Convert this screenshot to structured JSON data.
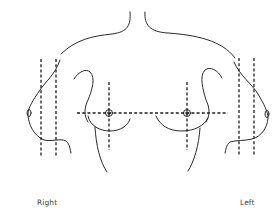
{
  "diagram": {
    "labels": {
      "right": "Right",
      "left": "Left"
    },
    "views": [
      {
        "id": "right-profile",
        "description": "right breast lateral profile with two vertical reference lines"
      },
      {
        "id": "frontal",
        "description": "frontal view of both breasts with horizontal and vertical reference lines through nipples"
      },
      {
        "id": "left-profile",
        "description": "left breast lateral profile with two vertical reference lines"
      }
    ],
    "colors": {
      "line": "#2a2a2a",
      "text": "#444444",
      "background": "#ffffff"
    }
  }
}
